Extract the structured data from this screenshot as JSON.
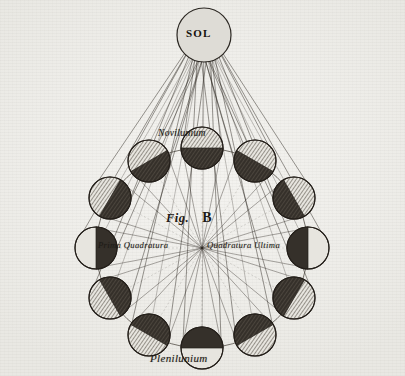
{
  "plate": {
    "figure_label": "Fig.",
    "figure_letter": "B",
    "paper_color": "#f1f0ed",
    "ink_color": "#2b2722"
  },
  "sun": {
    "label": "SOL",
    "cx": 204,
    "cy": 35,
    "r": 27,
    "fill": "#dedcd6",
    "stroke": "#2b2722"
  },
  "earth": {
    "cx": 202,
    "cy": 248
  },
  "orbit": {
    "cx": 202,
    "cy": 248,
    "rx": 106,
    "ry": 100,
    "stroke": "#3a342c"
  },
  "labels": {
    "new_moon": "Novilunium",
    "full_moon": "Plenilunium",
    "first_quarter": "Prima Quadratura",
    "last_quarter": "Quadratura Ultima"
  },
  "moon_style": {
    "r": 21,
    "lit_fill": "#e7e5df",
    "dark_fill": "#35302a",
    "stroke": "#241f1a",
    "hatch_color": "#4a443b"
  },
  "moons": [
    {
      "name": "novilunium",
      "angle_deg": -90,
      "cx": 202,
      "cy": 148,
      "phase": "new",
      "dark_dir_deg": 90,
      "hatched": true
    },
    {
      "name": "moon-2",
      "angle_deg": -60,
      "cx": 255,
      "cy": 161,
      "phase": "waxing-crescent",
      "dark_dir_deg": 120,
      "hatched": true
    },
    {
      "name": "moon-3",
      "angle_deg": -30,
      "cx": 294,
      "cy": 198,
      "phase": "waxing-crescent",
      "dark_dir_deg": 150,
      "hatched": true
    },
    {
      "name": "quadratura-ultima",
      "angle_deg": 0,
      "cx": 308,
      "cy": 248,
      "phase": "quarter",
      "dark_dir_deg": 180,
      "hatched": false
    },
    {
      "name": "moon-5",
      "angle_deg": 30,
      "cx": 294,
      "cy": 298,
      "phase": "waxing-gibbous",
      "dark_dir_deg": 210,
      "hatched": true
    },
    {
      "name": "moon-6",
      "angle_deg": 60,
      "cx": 255,
      "cy": 335,
      "phase": "waxing-gibbous",
      "dark_dir_deg": 240,
      "hatched": true
    },
    {
      "name": "plenilunium",
      "angle_deg": 90,
      "cx": 202,
      "cy": 348,
      "phase": "full",
      "dark_dir_deg": 270,
      "hatched": false
    },
    {
      "name": "moon-8",
      "angle_deg": 120,
      "cx": 149,
      "cy": 335,
      "phase": "waning-gibbous",
      "dark_dir_deg": 300,
      "hatched": true
    },
    {
      "name": "moon-9",
      "angle_deg": 150,
      "cx": 110,
      "cy": 298,
      "phase": "waning-gibbous",
      "dark_dir_deg": 330,
      "hatched": true
    },
    {
      "name": "prima-quadratura",
      "angle_deg": 180,
      "cx": 96,
      "cy": 248,
      "phase": "quarter",
      "dark_dir_deg": 0,
      "hatched": false
    },
    {
      "name": "moon-11",
      "angle_deg": 210,
      "cx": 110,
      "cy": 198,
      "phase": "waning-crescent",
      "dark_dir_deg": 30,
      "hatched": true
    },
    {
      "name": "moon-12",
      "angle_deg": 240,
      "cx": 149,
      "cy": 161,
      "phase": "waning-crescent",
      "dark_dir_deg": 60,
      "hatched": true
    }
  ]
}
